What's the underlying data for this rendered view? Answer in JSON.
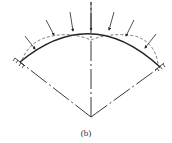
{
  "figure": {
    "caption": "(b)",
    "colors": {
      "line": "#222222",
      "dashed": "#555555"
    }
  }
}
